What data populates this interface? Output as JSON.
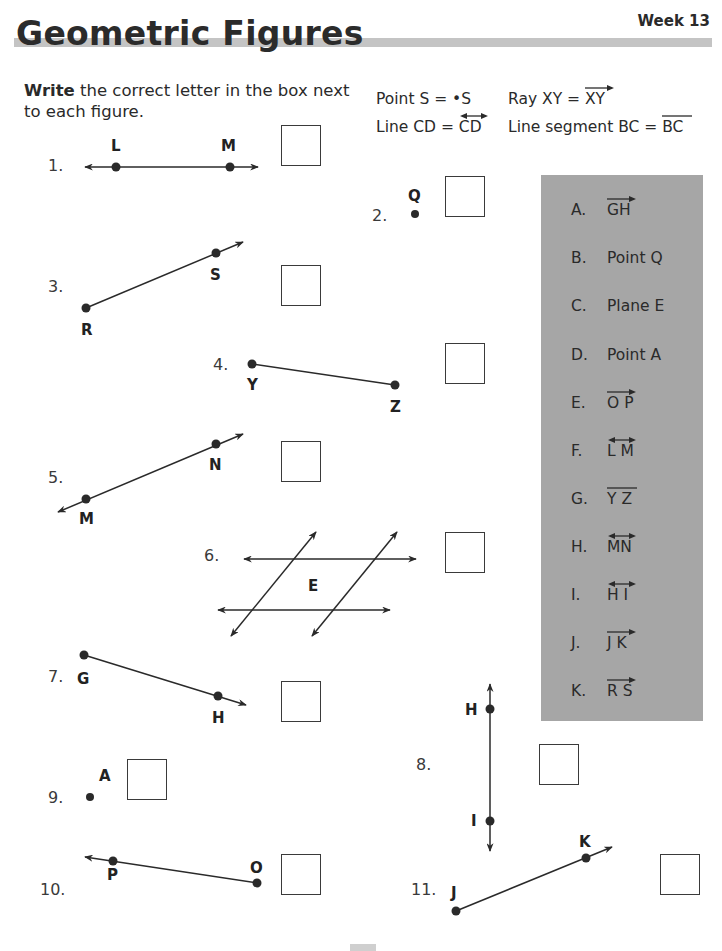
{
  "header": {
    "title": "Geometric Figures",
    "week": "Week 13"
  },
  "instructions": {
    "bold": "Write",
    "rest": " the correct letter in the box next to each figure."
  },
  "legend": {
    "point": {
      "label": "Point S = ",
      "symbol": "•S"
    },
    "ray": {
      "label": "Ray XY = ",
      "symbol": "XY"
    },
    "line": {
      "label": "Line CD = ",
      "symbol": "CD"
    },
    "segment": {
      "label": "Line segment BC = ",
      "symbol": "BC"
    }
  },
  "options": [
    {
      "letter": "A.",
      "text": "GH",
      "mark": "ray"
    },
    {
      "letter": "B.",
      "text": "Point Q",
      "mark": "none"
    },
    {
      "letter": "C.",
      "text": "Plane E",
      "mark": "none"
    },
    {
      "letter": "D.",
      "text": "Point A",
      "mark": "none"
    },
    {
      "letter": "E.",
      "text": "O P",
      "mark": "ray"
    },
    {
      "letter": "F.",
      "text": "L M",
      "mark": "line"
    },
    {
      "letter": "G.",
      "text": "Y Z",
      "mark": "segment"
    },
    {
      "letter": "H.",
      "text": "MN",
      "mark": "line"
    },
    {
      "letter": "I.",
      "text": "H I",
      "mark": "line"
    },
    {
      "letter": "J.",
      "text": "J K",
      "mark": "ray"
    },
    {
      "letter": "K.",
      "text": "R S",
      "mark": "ray"
    }
  ],
  "problems": [
    {
      "num": "1.",
      "labels": [
        "L",
        "M"
      ],
      "answer": ""
    },
    {
      "num": "2.",
      "labels": [
        "Q"
      ],
      "answer": ""
    },
    {
      "num": "3.",
      "labels": [
        "S",
        "R"
      ],
      "answer": ""
    },
    {
      "num": "4.",
      "labels": [
        "Y",
        "Z"
      ],
      "answer": ""
    },
    {
      "num": "5.",
      "labels": [
        "N",
        "M"
      ],
      "answer": ""
    },
    {
      "num": "6.",
      "labels": [
        "E"
      ],
      "answer": ""
    },
    {
      "num": "7.",
      "labels": [
        "G",
        "H"
      ],
      "answer": ""
    },
    {
      "num": "8.",
      "labels": [
        "H",
        "I"
      ],
      "answer": ""
    },
    {
      "num": "9.",
      "labels": [
        "A"
      ],
      "answer": ""
    },
    {
      "num": "10.",
      "labels": [
        "P",
        "O"
      ],
      "answer": ""
    },
    {
      "num": "11.",
      "labels": [
        "K",
        "J"
      ],
      "answer": ""
    }
  ],
  "colors": {
    "panel": "#a6a6a6",
    "title_bar": "#c4c4c4",
    "ink": "#2a2a2a"
  }
}
